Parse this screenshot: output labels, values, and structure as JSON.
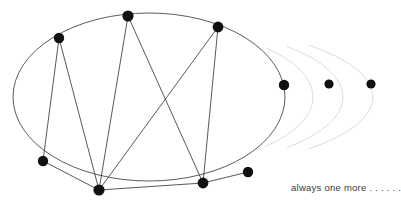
{
  "figure": {
    "background_color": "#ffffff",
    "stroke_color": "#4a4a4a",
    "chord_color": "#3a3a3a",
    "vertex_color": "#111111",
    "ghost_arc_color": "#d8d8d8",
    "main_ellipse": {
      "cx": 149,
      "cy": 97,
      "rx": 136,
      "ry": 84
    },
    "vertices": [
      {
        "id": "A",
        "label": "vertex-a",
        "x": 59,
        "y": 38,
        "r": 5.2
      },
      {
        "id": "B",
        "label": "vertex-b",
        "x": 128,
        "y": 16,
        "r": 5.6
      },
      {
        "id": "C",
        "label": "vertex-c",
        "x": 218,
        "y": 27,
        "r": 5.4
      },
      {
        "id": "D",
        "label": "vertex-d",
        "x": 43,
        "y": 161,
        "r": 5.2
      },
      {
        "id": "E",
        "label": "vertex-e",
        "x": 99,
        "y": 190,
        "r": 5.6
      },
      {
        "id": "F",
        "label": "vertex-f",
        "x": 203,
        "y": 183,
        "r": 5.4
      },
      {
        "id": "G",
        "label": "vertex-g",
        "x": 248,
        "y": 172,
        "r": 5.2
      },
      {
        "id": "H",
        "label": "vertex-h",
        "x": 284,
        "y": 85,
        "r": 5.2
      }
    ],
    "outer_dots": [
      {
        "id": "I",
        "label": "outer-dot-1",
        "x": 329,
        "y": 84,
        "r": 4.6
      },
      {
        "id": "J",
        "label": "outer-dot-2",
        "x": 371,
        "y": 84,
        "r": 4.6
      }
    ],
    "chords": [
      {
        "from": "A",
        "to": "D"
      },
      {
        "from": "A",
        "to": "E"
      },
      {
        "from": "B",
        "to": "E"
      },
      {
        "from": "B",
        "to": "F"
      },
      {
        "from": "C",
        "to": "E"
      },
      {
        "from": "C",
        "to": "F"
      },
      {
        "from": "D",
        "to": "E"
      },
      {
        "from": "E",
        "to": "F"
      },
      {
        "from": "F",
        "to": "G"
      }
    ],
    "ghost_arcs": [
      {
        "id": "arc-1",
        "cx": 149,
        "cy": 97,
        "rx": 164,
        "ry": 70
      },
      {
        "id": "arc-2",
        "cx": 149,
        "cy": 97,
        "rx": 194,
        "ry": 72
      },
      {
        "id": "arc-3",
        "cx": 149,
        "cy": 97,
        "rx": 224,
        "ry": 74
      }
    ]
  },
  "caption": {
    "text": "always one more . . . . . ."
  }
}
